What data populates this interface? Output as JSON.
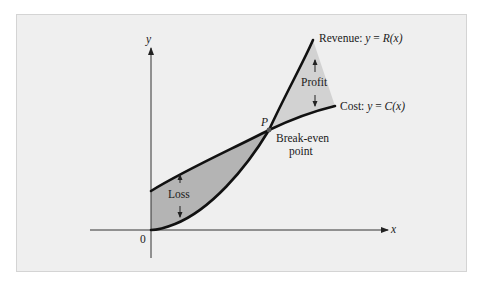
{
  "figure": {
    "axes": {
      "x_label": "x",
      "y_label": "y",
      "origin_label": "0"
    },
    "curves": {
      "revenue": {
        "label_prefix": "Revenue: ",
        "equation_y": "y",
        "equation_eq": " = ",
        "equation_fn": "R",
        "equation_arg": "(x)",
        "color": "#111111"
      },
      "cost": {
        "label_prefix": "Cost: ",
        "equation_y": "y",
        "equation_eq": " = ",
        "equation_fn": "C",
        "equation_arg": "(x)",
        "color": "#111111"
      }
    },
    "point": {
      "label": "P",
      "caption_line1": "Break-even",
      "caption_line2": "point"
    },
    "regions": {
      "loss": {
        "label": "Loss",
        "fill": "#b4b4b4"
      },
      "profit": {
        "label": "Profit",
        "fill": "#d2d2d2"
      }
    },
    "colors": {
      "background": "#efefef",
      "border": "#d4d4d4",
      "axis": "#333333"
    }
  }
}
